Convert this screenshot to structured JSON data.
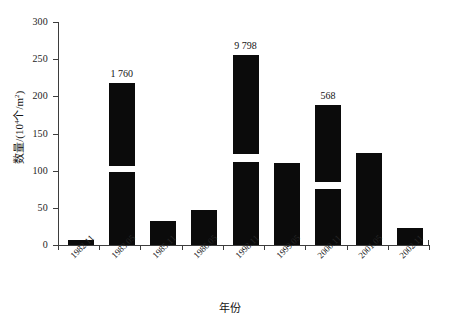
{
  "chart_data": {
    "type": "bar",
    "title": "",
    "xlabel": "年份",
    "ylabel": "数量/(10⁴个/m²)",
    "ylabel_base": "数量/(10",
    "ylabel_exp": "4",
    "ylabel_tail": "个/m",
    "ylabel_exp2": "2",
    "ylabel_close": ")",
    "categories": [
      "1982.11",
      "1983.05",
      "1985.11",
      "1986.05",
      "1998.11",
      "1999.05",
      "2000.11",
      "2001.05",
      "2002.11"
    ],
    "values": [
      7,
      218,
      32,
      47,
      256,
      110,
      188,
      124,
      23
    ],
    "ylim": [
      0,
      300
    ],
    "yticks": [
      0,
      50,
      100,
      150,
      200,
      250,
      300
    ],
    "ytick_labels": [
      "0",
      "50",
      "100",
      "150",
      "200",
      "250",
      "300"
    ],
    "grid": false,
    "legend": false,
    "bar_color": "#0b0b0b",
    "axis_color": "#3d3d3d",
    "broken_bars": [
      {
        "index": 1,
        "gap_low": 98,
        "gap_high": 106,
        "data_label": "1 760"
      },
      {
        "index": 4,
        "gap_low": 112,
        "gap_high": 122,
        "data_label": "9 798"
      },
      {
        "index": 6,
        "gap_low": 75,
        "gap_high": 85,
        "data_label": "568"
      }
    ],
    "data_labels": [
      {
        "index": 1,
        "text": "1 760"
      },
      {
        "index": 4,
        "text": "9 798"
      },
      {
        "index": 6,
        "text": "568"
      }
    ]
  },
  "axis": {
    "x_title": "年份",
    "y_title_parts": {
      "p1": "数量/(10",
      "sup1": "4",
      "p2": "个/m",
      "sup2": "2",
      "p3": ")"
    }
  },
  "ticks": {
    "y": [
      {
        "label": "300",
        "value": 300
      },
      {
        "label": "250",
        "value": 250
      },
      {
        "label": "200",
        "value": 200
      },
      {
        "label": "150",
        "value": 150
      },
      {
        "label": "100",
        "value": 100
      },
      {
        "label": "50",
        "value": 50
      },
      {
        "label": "0",
        "value": 0
      }
    ]
  }
}
